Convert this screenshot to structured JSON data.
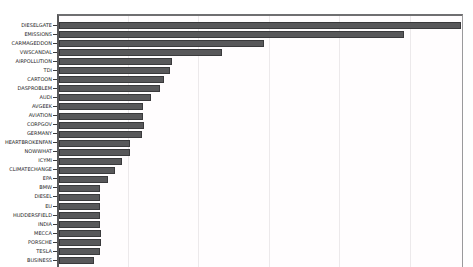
{
  "chart_data": {
    "type": "bar",
    "orientation": "horizontal",
    "title": "",
    "xlabel": "",
    "ylabel": "",
    "categories": [
      "DIESELGATE",
      "EMISSIONS",
      "CARMAGEDDON",
      "VWSCANDAL",
      "AIRPOLLUTION",
      "TDI",
      "CARTOON",
      "DASPROBLEM",
      "AUDI",
      "AVGEEK",
      "AVIATION",
      "CORPGOV",
      "GERMANY",
      "HEARTBROKENFAN",
      "NOWWHAT",
      "ICYMI",
      "CLIMATECHANGE",
      "EPA",
      "BMW",
      "DIESEL",
      "EU",
      "HUDDERSFIELD",
      "INDIA",
      "MECCA",
      "PORSCHE",
      "TESLA",
      "BUSINESS"
    ],
    "values": [
      5.69,
      4.89,
      2.9,
      2.31,
      1.6,
      1.57,
      1.49,
      1.43,
      1.3,
      1.19,
      1.19,
      1.2,
      1.18,
      1.01,
      1.01,
      0.89,
      0.79,
      0.69,
      0.58,
      0.58,
      0.58,
      0.58,
      0.58,
      0.59,
      0.59,
      0.58,
      0.5
    ],
    "xlim": [
      0,
      5.75
    ],
    "gridlines_x": [
      1,
      2,
      3,
      4,
      5
    ],
    "axis_note": "x-axis tick labels and chart title are cropped out of the visible screenshot; values are in gridline intervals",
    "legend": null,
    "grid": "vertical-only",
    "colors": {
      "bar_fill": "#58585a",
      "bar_border": "#3a3a3c",
      "gridline": "#ece9eb",
      "axis": "#6f6f71",
      "label_text": "#1c1c1e",
      "background": "#ffffff"
    }
  }
}
